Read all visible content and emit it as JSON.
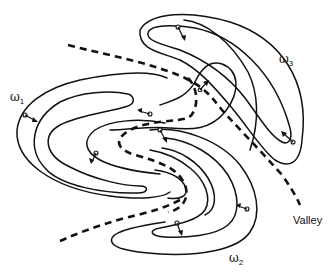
{
  "diagram": {
    "title": "",
    "labels": {
      "omega1": {
        "symbol": "ω",
        "subscript": "1"
      },
      "omega2": {
        "symbol": "ω",
        "subscript": "2"
      },
      "omega3": {
        "symbol": "ω",
        "subscript": "3"
      },
      "valley": "Valley"
    },
    "colors": {
      "line": "#111111",
      "background": "#ffffff"
    },
    "regions": [
      {
        "name": "omega1",
        "contour_count": 3,
        "position": "left"
      },
      {
        "name": "omega2",
        "contour_count": 4,
        "position": "bottom-center"
      },
      {
        "name": "omega3",
        "contour_count": 2,
        "position": "top-right"
      }
    ],
    "valley_lines": 3
  }
}
